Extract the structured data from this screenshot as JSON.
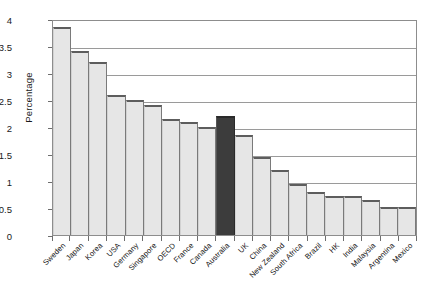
{
  "chart_data": {
    "type": "bar",
    "title": "",
    "xlabel": "",
    "ylabel": "Percentage",
    "ylim": [
      0,
      4
    ],
    "ytick_labels": [
      "4",
      "3.5",
      "3",
      "2.5",
      "2",
      "1.5",
      "1",
      "0.5",
      "0"
    ],
    "ytick_values": [
      4,
      3.5,
      3,
      2.5,
      2,
      1.5,
      1,
      0.5,
      0
    ],
    "grid": true,
    "legend": "none",
    "highlight_category": "Australia",
    "colors": {
      "bar_fill": "#e6e6e6",
      "bar_edge": "#5d5d5d",
      "highlight_fill": "#3c3c3c",
      "gridline": "#9a9a9a",
      "frame": "#8d8d8d",
      "text": "#111111"
    },
    "categories": [
      "Sweden",
      "Japan",
      "Korea",
      "USA",
      "Germany",
      "Singapore",
      "OECD",
      "France",
      "Canada",
      "Australia",
      "UK",
      "China",
      "New Zealand",
      "South Africa",
      "Brazil",
      "HK",
      "India",
      "Malaysia",
      "Argentina",
      "Mexico"
    ],
    "values": [
      3.85,
      3.4,
      3.2,
      2.6,
      2.5,
      2.4,
      2.15,
      2.1,
      2.0,
      2.2,
      1.85,
      1.45,
      1.2,
      0.95,
      0.8,
      0.72,
      0.72,
      0.65,
      0.52,
      0.52
    ]
  }
}
